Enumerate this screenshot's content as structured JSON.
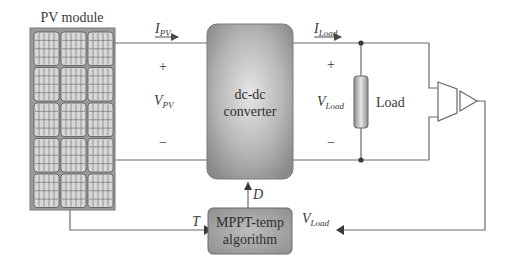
{
  "diagram": {
    "pv_module": {
      "label": "PV module",
      "rows": 5,
      "cols": 3
    },
    "converter": {
      "line1": "dc-dc",
      "line2": "converter"
    },
    "load": {
      "label": "Load"
    },
    "mppt": {
      "line1": "MPPT-temp",
      "line2": "algorithm"
    },
    "signals": {
      "i_pv": {
        "main": "I",
        "sub": "PV"
      },
      "v_pv": {
        "main": "V",
        "sub": "PV"
      },
      "i_load": {
        "main": "I",
        "sub": "Load"
      },
      "v_load": {
        "main": "V",
        "sub": "Load"
      },
      "v_load_feedback": {
        "main": "V",
        "sub": "Load"
      },
      "duty": {
        "main": "D"
      },
      "temp": {
        "main": "T"
      }
    },
    "polarity": {
      "plus": "+",
      "minus": "−"
    },
    "colors": {
      "line": "#6a6a6a",
      "pv_frame": "#8a8a8a",
      "block_dark": "#8c8c8c",
      "block_light": "#e4e4e4",
      "text": "#3a3a3a"
    }
  }
}
